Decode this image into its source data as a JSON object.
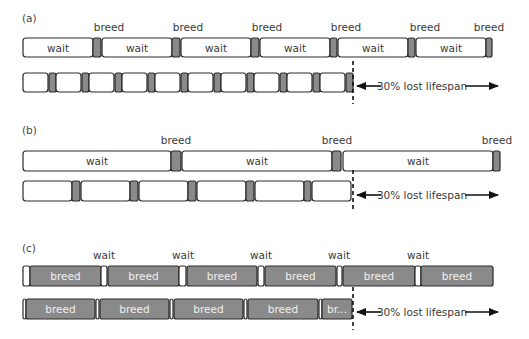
{
  "colors": {
    "wait": "#ffffff",
    "breed": "#8a8a8a",
    "stroke": "#2a2a2a"
  },
  "panels": [
    {
      "label": "(a)",
      "top_labels": [
        "breed",
        "breed",
        "breed",
        "breed",
        "breed",
        "breed"
      ],
      "top_segments": [
        {
          "type": "wait",
          "text": "wait"
        },
        {
          "type": "breed",
          "text": ""
        },
        {
          "type": "wait",
          "text": "wait"
        },
        {
          "type": "breed",
          "text": ""
        },
        {
          "type": "wait",
          "text": "wait"
        },
        {
          "type": "breed",
          "text": ""
        },
        {
          "type": "wait",
          "text": "wait"
        },
        {
          "type": "breed",
          "text": ""
        },
        {
          "type": "wait",
          "text": "wait"
        },
        {
          "type": "breed",
          "text": ""
        },
        {
          "type": "wait",
          "text": "wait"
        },
        {
          "type": "breed",
          "text": ""
        }
      ],
      "bottom_segment_count": 20,
      "annotation": "30% lost lifespan"
    },
    {
      "label": "(b)",
      "top_labels": [
        "breed",
        "breed",
        "breed"
      ],
      "top_segments": [
        {
          "type": "wait",
          "text": "wait"
        },
        {
          "type": "breed",
          "text": ""
        },
        {
          "type": "wait",
          "text": "wait"
        },
        {
          "type": "breed",
          "text": ""
        },
        {
          "type": "wait",
          "text": "wait"
        },
        {
          "type": "breed",
          "text": ""
        }
      ],
      "bottom_segment_count": 11,
      "annotation": "30% lost lifespan"
    },
    {
      "label": "(c)",
      "top_labels": [
        "wait",
        "wait",
        "wait",
        "wait",
        "wait"
      ],
      "top_segments": [
        {
          "type": "wait",
          "text": ""
        },
        {
          "type": "breed",
          "text": "breed"
        },
        {
          "type": "wait",
          "text": ""
        },
        {
          "type": "breed",
          "text": "breed"
        },
        {
          "type": "wait",
          "text": ""
        },
        {
          "type": "breed",
          "text": "breed"
        },
        {
          "type": "wait",
          "text": ""
        },
        {
          "type": "breed",
          "text": "breed"
        },
        {
          "type": "wait",
          "text": ""
        },
        {
          "type": "breed",
          "text": "breed"
        },
        {
          "type": "wait",
          "text": ""
        },
        {
          "type": "breed",
          "text": "breed"
        }
      ],
      "bottom_segments": [
        {
          "type": "wait",
          "text": ""
        },
        {
          "type": "breed",
          "text": "breed"
        },
        {
          "type": "wait",
          "text": ""
        },
        {
          "type": "breed",
          "text": "breed"
        },
        {
          "type": "wait",
          "text": ""
        },
        {
          "type": "breed",
          "text": "breed"
        },
        {
          "type": "wait",
          "text": ""
        },
        {
          "type": "breed",
          "text": "breed"
        },
        {
          "type": "wait",
          "text": ""
        },
        {
          "type": "breed",
          "text": "br..."
        }
      ],
      "annotation": "30% lost lifespan"
    }
  ]
}
